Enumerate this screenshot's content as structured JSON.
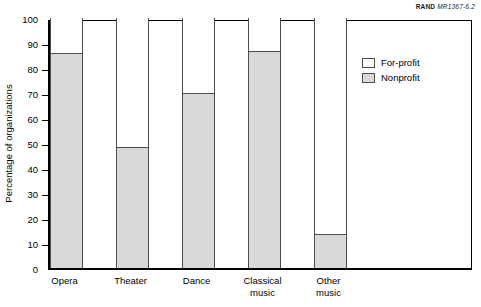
{
  "source_id": {
    "brand": "RAND",
    "code": "MR1367-6.2"
  },
  "axes": {
    "ylabel": "Percentage of organizations",
    "yticks": [
      "100",
      "90",
      "80",
      "70",
      "60",
      "50",
      "40",
      "30",
      "20",
      "10",
      "0"
    ],
    "xlabel": ""
  },
  "legend": {
    "position": "right",
    "items": [
      {
        "label": "For-profit",
        "color": "#ffffff"
      },
      {
        "label": "Nonprofit",
        "color": "#d9d9d9"
      }
    ]
  },
  "colors": {
    "nonprofit_fill": "#d9d9d9",
    "forprofit_fill": "#ffffff",
    "outline": "#4d4d4d",
    "axis": "#000000"
  },
  "chart_data": {
    "type": "bar",
    "title": "",
    "subtitle": "",
    "xlabel": "",
    "ylabel": "Percentage of organizations",
    "ylim": [
      0,
      100
    ],
    "ytick_step": 10,
    "grid": false,
    "stacked": true,
    "legend_position": "right",
    "categories": [
      "Opera",
      "Theater",
      "Dance",
      "Classical music",
      "Other music"
    ],
    "category_labels": [
      "Opera",
      "Theater",
      "Dance",
      "Classical\nmusic",
      "Other\nmusic"
    ],
    "series": [
      {
        "name": "Nonprofit",
        "color": "#d9d9d9",
        "values": [
          86,
          48.5,
          70,
          87,
          13.5
        ]
      },
      {
        "name": "For-profit",
        "color": "#ffffff",
        "values": [
          14,
          51.5,
          30,
          13,
          86.5
        ]
      }
    ],
    "annotations": [
      "RAND MR1367-6.2"
    ]
  }
}
